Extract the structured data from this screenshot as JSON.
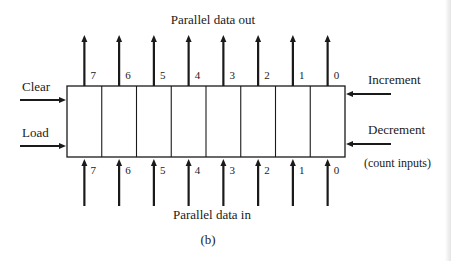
{
  "figure": {
    "caption": "(b)",
    "top_label": "Parallel data out",
    "bottom_label": "Parallel data in",
    "left_inputs": [
      {
        "label": "Clear",
        "y": 100
      },
      {
        "label": "Load",
        "y": 146
      }
    ],
    "right_inputs": [
      {
        "label": "Increment",
        "y": 94
      },
      {
        "label": "Decrement",
        "y": 144
      }
    ],
    "right_note": "(count inputs)",
    "register": {
      "x": 67,
      "y": 86,
      "width": 278,
      "height": 71,
      "cells": 8,
      "bits": [
        "7",
        "6",
        "5",
        "4",
        "3",
        "2",
        "1",
        "0"
      ]
    },
    "colors": {
      "line": "#1a1a1a",
      "background": "#ffffff"
    }
  }
}
